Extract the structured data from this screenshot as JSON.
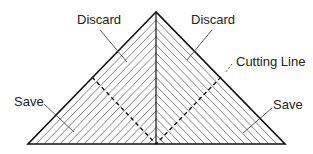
{
  "diagram": {
    "title": "",
    "labels": {
      "discard_left": "Discard",
      "discard_right": "Discard",
      "cutting_line": "Cutting Line",
      "save_left": "Save",
      "save_right": "Save"
    },
    "colors": {
      "outline": "#111111",
      "hatch": "#666666",
      "text": "#222222",
      "background": "#ffffff"
    },
    "geometry": {
      "apex": [
        156,
        12
      ],
      "base_left": [
        28,
        144
      ],
      "base_right": [
        285,
        144
      ],
      "center_line": [
        [
          156,
          12
        ],
        [
          156,
          144
        ]
      ],
      "cut_left": [
        [
          92,
          77
        ],
        [
          156,
          144
        ]
      ],
      "cut_right": [
        [
          221,
          77
        ],
        [
          156,
          144
        ]
      ]
    }
  }
}
